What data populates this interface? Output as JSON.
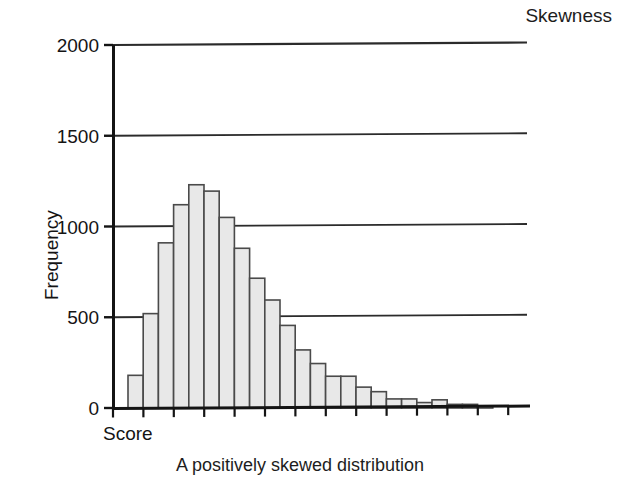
{
  "title": "Skewness",
  "caption": "A positively skewed distribution",
  "axes": {
    "y_label": "Frequency",
    "x_label": "Score",
    "y_ticks": [
      "0",
      "500",
      "1000",
      "1500",
      "2000"
    ]
  },
  "chart_data": {
    "type": "bar",
    "title": "Skewness",
    "subtitle": "A positively skewed distribution",
    "xlabel": "Score",
    "ylabel": "Frequency",
    "ylim": [
      0,
      2000
    ],
    "yticks": [
      0,
      500,
      1000,
      1500,
      2000
    ],
    "grid": "horizontal",
    "legend": "none",
    "bar_style": "histogram-adjacent",
    "categories": [
      "1",
      "2",
      "3",
      "4",
      "5",
      "6",
      "7",
      "8",
      "9",
      "10",
      "11",
      "12",
      "13",
      "14",
      "15",
      "16",
      "17",
      "18",
      "19",
      "20",
      "21",
      "22",
      "23",
      "24",
      "25",
      "26"
    ],
    "values": [
      180,
      520,
      910,
      1120,
      1230,
      1195,
      1050,
      880,
      715,
      595,
      455,
      320,
      245,
      175,
      175,
      115,
      90,
      50,
      50,
      30,
      45,
      20,
      20,
      10,
      0,
      0
    ],
    "colors": {
      "bar_fill": "#e8e8e8",
      "bar_stroke": "#4a4a4a",
      "axis": "#141414",
      "grid": "#2b2b2b",
      "background": "#ffffff"
    }
  }
}
